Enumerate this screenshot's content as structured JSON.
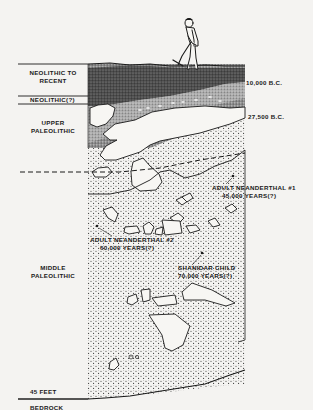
{
  "diagram": {
    "period_labels": {
      "neolithic_to_recent_line1": "NEOLITHIC TO",
      "neolithic_to_recent_line2": "RECENT",
      "neolithic_uncertain": "NEOLITHIC(?)",
      "upper_paleolithic_line1": "UPPER",
      "upper_paleolithic_line2": "PALEOLITHIC",
      "middle_paleolithic_line1": "MIDDLE",
      "middle_paleolithic_line2": "PALEOLITHIC",
      "bedrock": "BEDROCK"
    },
    "dates": {
      "date_top": "10,000 B.C.",
      "date_upper": "27,500 B.C."
    },
    "depth": {
      "label": "45 FEET"
    },
    "finds": [
      {
        "name_line1": "ADULT NEANDERTHAL #1",
        "name_line2": "45,000 YEARS(?)"
      },
      {
        "name_line1": "ADULT NEANDERTHAL #2",
        "name_line2": "60,000 YEARS(?)"
      },
      {
        "name_line1": "SHANIDAR CHILD",
        "name_line2": "70,000 YEARS(?)"
      }
    ],
    "figure": "excavator-with-pickaxe",
    "colors": {
      "background": "#f4f3f1",
      "ink": "#1a1a1a",
      "dark_layer": "#3a3a3a",
      "mid_layer": "#7a7a7a",
      "rock_fill": "#f7f6f3"
    }
  }
}
